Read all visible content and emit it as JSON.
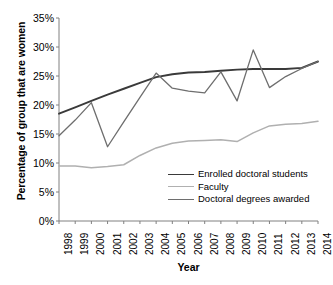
{
  "chart_data": {
    "type": "line",
    "title": "",
    "xlabel": "Year",
    "ylabel": "Percentage of group that are women",
    "x": [
      1998,
      1999,
      2000,
      2001,
      2002,
      2003,
      2004,
      2005,
      2006,
      2007,
      2008,
      2009,
      2010,
      2011,
      2012,
      2013,
      2014
    ],
    "categories": [
      "1998",
      "1999",
      "2000",
      "2001",
      "2002",
      "2003",
      "2004",
      "2005",
      "2006",
      "2007",
      "2008",
      "2009",
      "2010",
      "2011",
      "2012",
      "2013",
      "2014"
    ],
    "ylim": [
      0,
      35
    ],
    "yticks": [
      0,
      5,
      10,
      15,
      20,
      25,
      30,
      35
    ],
    "ytick_labels": [
      "0%",
      "5%",
      "10%",
      "15%",
      "20%",
      "25%",
      "30%",
      "35%"
    ],
    "grid": false,
    "legend_position": "inside-lower-right",
    "series": [
      {
        "name": "Enrolled doctoral students",
        "color": "#3a3a3a",
        "width": 1.9,
        "values": [
          18.5,
          19.6,
          20.7,
          21.8,
          22.8,
          23.8,
          24.8,
          25.3,
          25.6,
          25.7,
          25.9,
          26.1,
          26.2,
          26.2,
          26.2,
          26.4,
          27.5
        ]
      },
      {
        "name": "Faculty",
        "color": "#b0b0b0",
        "width": 1.5,
        "values": [
          9.5,
          9.5,
          9.2,
          9.4,
          9.7,
          11.3,
          12.6,
          13.4,
          13.8,
          13.9,
          14.0,
          13.7,
          15.2,
          16.4,
          16.7,
          16.8,
          17.2
        ]
      },
      {
        "name": "Doctoral degrees awarded",
        "color": "#6e6e6e",
        "width": 1.3,
        "values": [
          14.7,
          17.4,
          20.4,
          12.8,
          17.1,
          21.3,
          25.5,
          22.9,
          22.4,
          22.1,
          25.7,
          20.7,
          29.5,
          23.0,
          24.9,
          26.3,
          27.5
        ]
      }
    ]
  }
}
